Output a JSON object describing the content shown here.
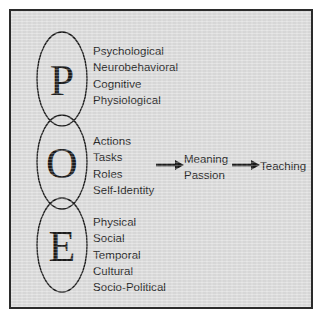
{
  "figure": {
    "background_color": "#dcdcdc",
    "border_color": "#2b2b2b",
    "text_color": "#222222"
  },
  "venn": {
    "circles": [
      {
        "letter": "P",
        "name": "person",
        "icon": "ellipse-outline"
      },
      {
        "letter": "O",
        "name": "occupation",
        "icon": "ellipse-outline"
      },
      {
        "letter": "E",
        "name": "environment",
        "icon": "ellipse-outline"
      }
    ]
  },
  "groups": [
    {
      "key": "person",
      "letter": "P",
      "items": [
        "Psychological",
        "Neurobehavioral",
        "Cognitive",
        "Physiological"
      ],
      "text": "Psychological\nNeurobehavioral\nCognitive\nPhysiological"
    },
    {
      "key": "occupation",
      "letter": "O",
      "items": [
        "Actions",
        "Tasks",
        "Roles",
        "Self-Identity"
      ],
      "text": "Actions\nTasks\nRoles\nSelf-Identity"
    },
    {
      "key": "environment",
      "letter": "E",
      "items": [
        "Physical",
        "Social",
        "Temporal",
        "Cultural",
        "Socio-Political"
      ],
      "text": "Physical\nSocial\nTemporal\nCultural\nSocio-Political"
    }
  ],
  "flow": {
    "arrow_1": "arrow-right-icon",
    "outcome": {
      "line_1": "Meaning",
      "line_2": "Passion",
      "text": "Meaning\nPassion"
    },
    "arrow_2": "arrow-right-icon",
    "result": "Teaching"
  }
}
